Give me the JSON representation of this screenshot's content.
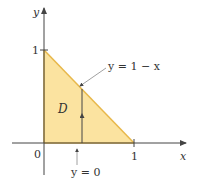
{
  "diagram": {
    "axes": {
      "x_label": "x",
      "y_label": "y"
    },
    "ticks": {
      "origin": "0",
      "x_one": "1",
      "y_one": "1"
    },
    "region": {
      "label": "D",
      "fill": "#fbe3a0",
      "edge": "#e8b84a"
    },
    "annotations": {
      "hypotenuse": "y = 1 − x",
      "bottom": "y = 0"
    },
    "colors": {
      "axis": "#444444",
      "text": "#333333"
    }
  }
}
